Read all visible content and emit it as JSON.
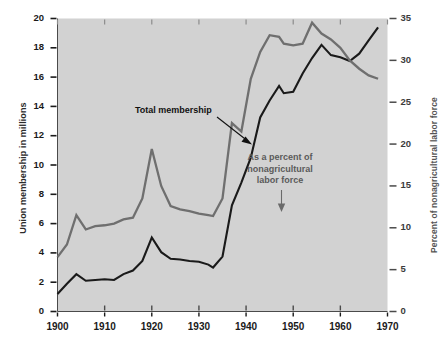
{
  "chart_data": {
    "type": "line",
    "title": "",
    "subtitle": "",
    "xlabel": "",
    "ylabel": "Union membership in millions",
    "y2label": "Percent of nonagricultural labor force",
    "xlim": [
      1900,
      1970
    ],
    "ylim": [
      0,
      20
    ],
    "y2lim": [
      0,
      35
    ],
    "grid": false,
    "legend_position": "inline-annotations",
    "xticks": [
      1900,
      1910,
      1920,
      1930,
      1940,
      1950,
      1960,
      1970
    ],
    "xtick_labels": [
      "1900",
      "1910",
      "1920",
      "1930",
      "1940",
      "1950",
      "1960",
      "1970"
    ],
    "yticks": [
      0,
      2,
      4,
      6,
      8,
      10,
      12,
      14,
      16,
      18,
      20
    ],
    "ytick_labels": [
      "0",
      "2",
      "4",
      "6",
      "8",
      "10",
      "12",
      "14",
      "16",
      "18",
      "20"
    ],
    "y2ticks": [
      0,
      5,
      10,
      15,
      20,
      25,
      30,
      35
    ],
    "y2tick_labels": [
      "0",
      "5",
      "10",
      "15",
      "20",
      "25",
      "30",
      "35"
    ],
    "annotations": [
      {
        "name": "total-membership",
        "lines": [
          "Total  membership"
        ],
        "color": "#111111",
        "arrow": "down-right"
      },
      {
        "name": "percent-of-nonagricultural-labor-force",
        "lines": [
          "As a percent of",
          "nonagricultural",
          "labor force"
        ],
        "color": "#5a5a5a",
        "arrow": "down"
      }
    ],
    "series": [
      {
        "name": "Total membership",
        "axis": "left",
        "color": "#1a1a1a",
        "units": "millions",
        "x": [
          1900,
          1902,
          1904,
          1906,
          1908,
          1910,
          1912,
          1914,
          1916,
          1918,
          1920,
          1922,
          1924,
          1926,
          1928,
          1930,
          1932,
          1933,
          1935,
          1937,
          1939,
          1941,
          1943,
          1945,
          1947,
          1948,
          1950,
          1952,
          1954,
          1956,
          1958,
          1960,
          1962,
          1964,
          1966,
          1968
        ],
        "values": [
          1.2,
          1.9,
          2.55,
          2.1,
          2.15,
          2.2,
          2.15,
          2.55,
          2.8,
          3.45,
          5.05,
          4.05,
          3.6,
          3.55,
          3.45,
          3.4,
          3.2,
          3.0,
          3.75,
          7.25,
          8.8,
          10.5,
          13.25,
          14.4,
          15.4,
          14.9,
          15.0,
          16.25,
          17.3,
          18.2,
          17.5,
          17.35,
          17.1,
          17.6,
          18.5,
          19.4
        ]
      },
      {
        "name": "As a percent of nonagricultural labor force",
        "axis": "right",
        "color": "#6f6f6f",
        "units": "percent",
        "x": [
          1900,
          1902,
          1904,
          1906,
          1908,
          1910,
          1912,
          1914,
          1916,
          1918,
          1920,
          1922,
          1924,
          1926,
          1928,
          1930,
          1932,
          1933,
          1935,
          1937,
          1939,
          1941,
          1943,
          1945,
          1947,
          1948,
          1950,
          1952,
          1954,
          1956,
          1958,
          1960,
          1962,
          1964,
          1966,
          1968
        ],
        "values": [
          6.5,
          8.0,
          11.5,
          9.8,
          10.2,
          10.3,
          10.5,
          11.0,
          11.2,
          13.5,
          19.4,
          15.0,
          12.6,
          12.2,
          12.0,
          11.7,
          11.5,
          11.4,
          13.5,
          22.5,
          21.5,
          27.8,
          31.0,
          33.0,
          32.8,
          32.0,
          31.8,
          32.0,
          34.5,
          33.2,
          32.5,
          31.5,
          30.0,
          29.0,
          28.2,
          27.8
        ]
      }
    ]
  }
}
